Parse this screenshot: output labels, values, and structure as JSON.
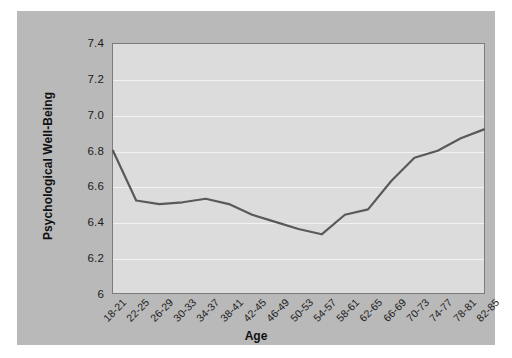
{
  "chart_data": {
    "type": "line",
    "title": "",
    "xlabel": "Age",
    "ylabel": "Psychological Well-Being",
    "categories": [
      "18-21",
      "22-25",
      "26-29",
      "30-33",
      "34-37",
      "38-41",
      "42-45",
      "46-49",
      "50-53",
      "54-57",
      "58-61",
      "62-65",
      "66-69",
      "70-73",
      "74-77",
      "78-81",
      "82-85"
    ],
    "values": [
      6.8,
      6.52,
      6.5,
      6.51,
      6.53,
      6.5,
      6.44,
      6.4,
      6.36,
      6.33,
      6.44,
      6.47,
      6.63,
      6.76,
      6.8,
      6.87,
      6.92
    ],
    "series": [
      {
        "name": "Psychological Well-Being",
        "values": [
          6.8,
          6.52,
          6.5,
          6.51,
          6.53,
          6.5,
          6.44,
          6.4,
          6.36,
          6.33,
          6.44,
          6.47,
          6.63,
          6.76,
          6.8,
          6.87,
          6.92
        ]
      }
    ],
    "ylim": [
      6.0,
      7.4
    ],
    "yticks": [
      6.0,
      6.2,
      6.4,
      6.6,
      6.8,
      7.0,
      7.2,
      7.4
    ],
    "ytick_labels": [
      "6",
      "6.2",
      "6.4",
      "6.6",
      "6.8",
      "7.0",
      "7.2",
      "7.4"
    ],
    "grid": true,
    "legend": "none",
    "line_color": "#595959",
    "plot_bg_color": "#dcdcdc",
    "panel_bg_color": "#b9b9b9",
    "gridline_color": "#f2f2f2",
    "axis_color": "#7c7c7c"
  }
}
